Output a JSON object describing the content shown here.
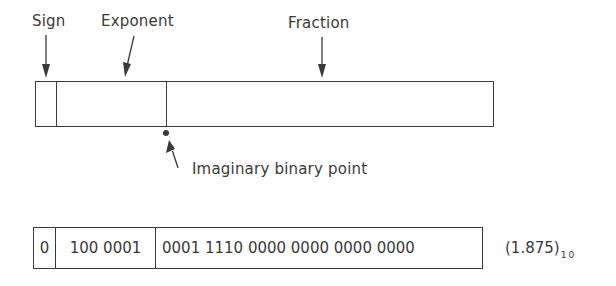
{
  "diagram": {
    "labels": {
      "sign": "Sign",
      "exponent": "Exponent",
      "fraction": "Fraction",
      "binary_point": "Imaginary binary point"
    },
    "format_fields": [
      {
        "name": "sign",
        "width_px": 21
      },
      {
        "name": "exponent",
        "width_px": 110
      },
      {
        "name": "fraction",
        "width_px": 327
      }
    ],
    "example": {
      "sign_bits": "0",
      "exponent_bits": "100 0001",
      "fraction_bits": "0001 1110 0000 0000 0000 0000",
      "decimal_value": "(1.875)",
      "decimal_base": "10"
    },
    "colors": {
      "line": "#3a3a3a",
      "text": "#3a3a3a",
      "background": "#ffffff"
    }
  }
}
